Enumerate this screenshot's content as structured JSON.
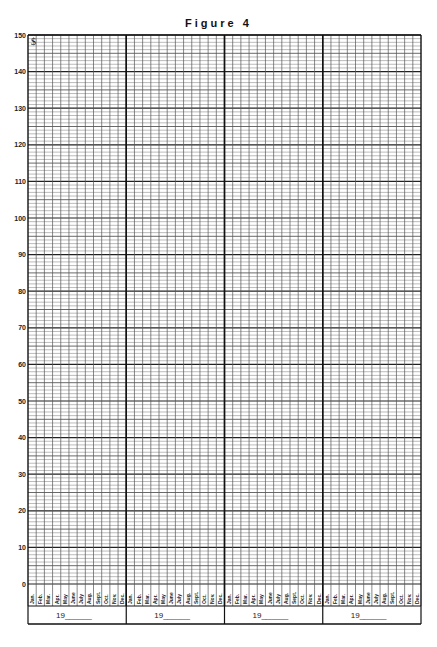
{
  "title": "Figure 4",
  "corner_symbol": "$",
  "chart_data": {
    "type": "line",
    "title": "Figure 4",
    "xlabel": "",
    "ylabel": "",
    "ylim": [
      0,
      150
    ],
    "y_ticks": [
      0,
      10,
      20,
      30,
      40,
      50,
      60,
      70,
      80,
      90,
      100,
      110,
      120,
      130,
      140,
      150
    ],
    "y_minor_step": 1,
    "grid": true,
    "legend": null,
    "years": [
      "19______",
      "19______",
      "19______",
      "19______"
    ],
    "months": [
      "Jan.",
      "Feb.",
      "Mar.",
      "Apr.",
      "May",
      "June",
      "July",
      "Aug.",
      "Sept.",
      "Oct.",
      "Nov.",
      "Dec."
    ],
    "series": [],
    "note": "Blank grid chart template: 4 years x 12 months, y-axis 0-150"
  },
  "layout": {
    "plot_left": 28,
    "plot_right": 421,
    "plot_top": 35,
    "plot_bottom": 584,
    "month_strip_bottom": 606,
    "year_box_bottom": 624
  }
}
